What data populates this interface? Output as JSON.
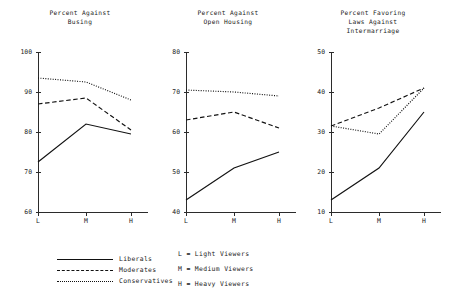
{
  "chart_data": [
    {
      "type": "line",
      "title": "Percent Against\nBusing",
      "xlabel": "",
      "ylabel": "",
      "categories": [
        "L",
        "M",
        "H"
      ],
      "ylim": [
        60,
        100
      ],
      "yticks": [
        60,
        70,
        80,
        90,
        100
      ],
      "grid": false,
      "legend_position": "below-left",
      "series": [
        {
          "name": "Liberals",
          "style": "solid",
          "values": [
            72.5,
            82.0,
            79.5
          ]
        },
        {
          "name": "Moderates",
          "style": "dashed",
          "values": [
            87.0,
            88.5,
            80.5
          ]
        },
        {
          "name": "Conservatives",
          "style": "dotted",
          "values": [
            93.5,
            92.5,
            88.0
          ]
        }
      ]
    },
    {
      "type": "line",
      "title": "Percent Against\nOpen Housing",
      "xlabel": "",
      "ylabel": "",
      "categories": [
        "L",
        "M",
        "H"
      ],
      "ylim": [
        40,
        80
      ],
      "yticks": [
        40,
        50,
        60,
        70,
        80
      ],
      "grid": false,
      "legend_position": "below-left",
      "series": [
        {
          "name": "Liberals",
          "style": "solid",
          "values": [
            43.0,
            51.0,
            55.0
          ]
        },
        {
          "name": "Moderates",
          "style": "dashed",
          "values": [
            63.0,
            65.0,
            61.0
          ]
        },
        {
          "name": "Conservatives",
          "style": "dotted",
          "values": [
            70.5,
            70.0,
            69.0
          ]
        }
      ]
    },
    {
      "type": "line",
      "title": "Percent Favoring\nLaws Against\nIntermarriage",
      "xlabel": "",
      "ylabel": "",
      "categories": [
        "L",
        "M",
        "H"
      ],
      "ylim": [
        10,
        50
      ],
      "yticks": [
        10,
        20,
        30,
        40,
        50
      ],
      "grid": false,
      "legend_position": "below-left",
      "series": [
        {
          "name": "Liberals",
          "style": "solid",
          "values": [
            13.0,
            21.0,
            35.0
          ]
        },
        {
          "name": "Moderates",
          "style": "dashed",
          "values": [
            31.5,
            36.0,
            41.0
          ]
        },
        {
          "name": "Conservatives",
          "style": "dotted",
          "values": [
            31.5,
            29.5,
            41.0
          ]
        }
      ]
    }
  ],
  "panels": [
    {
      "title": "Percent Against\nBusing"
    },
    {
      "title": "Percent Against\nOpen Housing"
    },
    {
      "title": "Percent Favoring\nLaws Against\nIntermarriage"
    }
  ],
  "legend": {
    "items": [
      {
        "label": "Liberals",
        "style": "solid"
      },
      {
        "label": "Moderates",
        "style": "dashed"
      },
      {
        "label": "Conservatives",
        "style": "dotted"
      }
    ]
  },
  "key": {
    "rows": [
      "L = Light Viewers",
      "M = Medium Viewers",
      "H = Heavy Viewers"
    ]
  }
}
